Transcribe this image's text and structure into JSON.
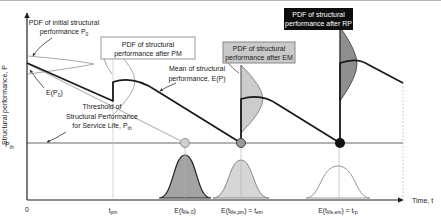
{
  "figure": {
    "y_axis_label": "Structural performance, P",
    "x_axis_label": "Time, t",
    "origin_label": "0",
    "threshold_axis_label": {
      "main": "P",
      "sub": "th"
    }
  },
  "annotations": {
    "initial_pdf": {
      "line1": "PDF of initial structural",
      "line2_main": "performance P",
      "line2_sub": "0"
    },
    "e_p0": {
      "main": "E(P",
      "sub": "0",
      "close": ")"
    },
    "threshold_note": {
      "line1": "Threshold of",
      "line2": "Structural Performance",
      "line3_main": "for Service Life, P",
      "line3_sub": "th"
    },
    "mean": {
      "line1": "Mean of structural",
      "line2": "performance, E(P)"
    },
    "pm_box": {
      "line1": "PDF of structural",
      "line2": "performance after PM"
    },
    "em_box": {
      "line1": "PDF of structural",
      "line2": "performance after EM"
    },
    "rp_box": {
      "line1": "PDF of structural",
      "line2": "performance after RP"
    }
  },
  "ticks": {
    "t_pm": {
      "main": "t",
      "sub": "pm"
    },
    "e_tlife0": {
      "p1": "E(t",
      "s1": "life,0",
      "p2": ")"
    },
    "e_tlifepm": {
      "p1": "E(t",
      "s1": "life,pm",
      "p2": ") = t",
      "s2": "em"
    },
    "e_tlifeem": {
      "p1": "E(t",
      "s1": "life,em",
      "p2": ") = t",
      "s2": "rp"
    }
  },
  "colors": {
    "curve": "#1a1a1a",
    "no_maintenance_line": "#b8b8b8",
    "threshold_line": "#9a9a9a",
    "pdf_pm_outline": "#aaaaaa",
    "pdf_em_fill": "#cccccc",
    "pdf_rp_fill": "#8f8f8f",
    "bell1_fill": "#a3a3a3",
    "bell2_fill": "#d6d6d6",
    "em_box_fill": "#c9c9c9",
    "rp_box_fill": "#0d0d0d"
  }
}
